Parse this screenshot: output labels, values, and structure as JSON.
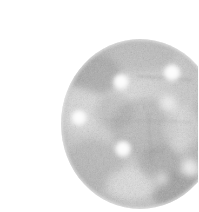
{
  "image": {
    "kind": "scanned-photograph",
    "subject": "perforated circular disc",
    "background_color": "#ffffff",
    "width": 198,
    "height": 212,
    "rendering": "grayscale halftone grain",
    "tone_light": "#f2f2f2",
    "tone_mid": "#c9c9c9",
    "tone_dark": "#8e8e8e",
    "tone_shadow": "#6e6e6e",
    "hole_color": "#fbfbfb"
  },
  "disc": {
    "label": "perforated disc",
    "center_x": 100,
    "center_y": 108,
    "radius_x": 79,
    "radius_y": 85,
    "edge_color": "#b4b4b4",
    "body_color": "#cfcfcf"
  },
  "holes": [
    {
      "name": "hole-upper-left-center",
      "cx": 81,
      "cy": 66,
      "r": 8.0,
      "opacity": 1.0
    },
    {
      "name": "hole-upper-right",
      "cx": 132,
      "cy": 57,
      "r": 8.5,
      "opacity": 1.0
    },
    {
      "name": "hole-left",
      "cx": 39,
      "cy": 102,
      "r": 8.0,
      "opacity": 1.0
    },
    {
      "name": "hole-right-upper",
      "cx": 128,
      "cy": 88,
      "r": 9.0,
      "opacity": 0.62
    },
    {
      "name": "hole-center-lower",
      "cx": 83,
      "cy": 133,
      "r": 8.0,
      "opacity": 1.0
    },
    {
      "name": "hole-right-lower",
      "cx": 150,
      "cy": 152,
      "r": 8.5,
      "opacity": 0.7
    },
    {
      "name": "hole-bottom-right",
      "cx": 122,
      "cy": 163,
      "r": 7.0,
      "opacity": 0.55
    }
  ],
  "shading": [
    {
      "name": "shade-upper-left-dark",
      "cx": 55,
      "cy": 58,
      "rx": 26,
      "ry": 20,
      "color": "#8d8d8d",
      "opacity": 0.55
    },
    {
      "name": "shade-upper-rim",
      "cx": 96,
      "cy": 40,
      "rx": 40,
      "ry": 16,
      "color": "#a8a8a8",
      "opacity": 0.4
    },
    {
      "name": "shade-center-mid",
      "cx": 104,
      "cy": 112,
      "rx": 34,
      "ry": 30,
      "color": "#9c9c9c",
      "opacity": 0.45
    },
    {
      "name": "shade-lower-left",
      "cx": 54,
      "cy": 150,
      "rx": 30,
      "ry": 26,
      "color": "#a2a2a2",
      "opacity": 0.42
    },
    {
      "name": "shade-lower-right-dark",
      "cx": 140,
      "cy": 175,
      "rx": 30,
      "ry": 18,
      "color": "#7e7e7e",
      "opacity": 0.5
    },
    {
      "name": "shade-right-edge",
      "cx": 164,
      "cy": 120,
      "rx": 18,
      "ry": 36,
      "color": "#a0a0a0",
      "opacity": 0.38
    },
    {
      "name": "highlight-lower-center",
      "cx": 92,
      "cy": 168,
      "rx": 26,
      "ry": 16,
      "color": "#f4f4f4",
      "opacity": 0.55
    },
    {
      "name": "highlight-right-mid",
      "cx": 142,
      "cy": 112,
      "rx": 18,
      "ry": 22,
      "color": "#efefef",
      "opacity": 0.45
    }
  ],
  "scratches": [
    {
      "name": "scratch-upper-horizontal",
      "x1": 96,
      "y1": 60,
      "x2": 152,
      "y2": 64,
      "color": "#8a8a8a",
      "opacity": 0.55
    },
    {
      "name": "scratch-mid-horizontal",
      "x1": 64,
      "y1": 104,
      "x2": 150,
      "y2": 106,
      "color": "#9a9a9a",
      "opacity": 0.4
    },
    {
      "name": "scratch-center-vertical",
      "x1": 108,
      "y1": 96,
      "x2": 112,
      "y2": 150,
      "color": "#8f8f8f",
      "opacity": 0.45
    }
  ]
}
